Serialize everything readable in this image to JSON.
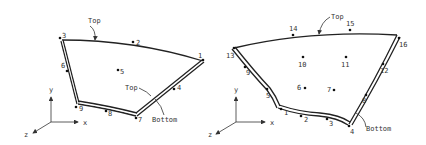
{
  "figures": [
    {
      "id": "left",
      "description": "9-node shell element",
      "nodes": [
        {
          "label": "1",
          "x": 203,
          "y": 60,
          "lx": 199,
          "ly": 57
        },
        {
          "label": "2",
          "x": 133,
          "y": 42,
          "lx": 137,
          "ly": 44
        },
        {
          "label": "3",
          "x": 60,
          "y": 39,
          "lx": 63,
          "ly": 37
        },
        {
          "label": "4",
          "x": 174,
          "y": 89,
          "lx": 177,
          "ly": 90
        },
        {
          "label": "5",
          "x": 118,
          "y": 70,
          "lx": 120,
          "ly": 74
        },
        {
          "label": "6",
          "x": 67,
          "y": 71,
          "lx": 61,
          "ly": 68
        },
        {
          "label": "7",
          "x": 136,
          "y": 117,
          "lx": 138,
          "ly": 122
        },
        {
          "label": "8",
          "x": 106,
          "y": 111,
          "lx": 108,
          "ly": 116
        },
        {
          "label": "9",
          "x": 77,
          "y": 106,
          "lx": 79,
          "ly": 111
        }
      ],
      "labels": [
        {
          "text": "Top",
          "x": 88,
          "y": 23
        },
        {
          "text": "Top",
          "x": 126,
          "y": 90
        },
        {
          "text": "Bottom",
          "x": 152,
          "y": 122
        }
      ],
      "axes": {
        "origin": [
          51,
          122
        ],
        "x_label": "x",
        "y_label": "y",
        "z_label": "z"
      }
    },
    {
      "id": "right",
      "description": "16-node shell element",
      "nodes": [
        {
          "label": "1",
          "x": 281,
          "y": 109,
          "lx": 284,
          "ly": 115
        },
        {
          "label": "2",
          "x": 301,
          "y": 116,
          "lx": 304,
          "ly": 122
        },
        {
          "label": "3",
          "x": 327,
          "y": 119,
          "lx": 329,
          "ly": 126
        },
        {
          "label": "4",
          "x": 349,
          "y": 126,
          "lx": 350,
          "ly": 134
        },
        {
          "label": "5",
          "x": 267,
          "y": 89,
          "lx": 266,
          "ly": 98
        },
        {
          "label": "6",
          "x": 305,
          "y": 88,
          "lx": 297,
          "ly": 90
        },
        {
          "label": "7",
          "x": 334,
          "y": 90,
          "lx": 327,
          "ly": 92
        },
        {
          "label": "8",
          "x": 366,
          "y": 95,
          "lx": 362,
          "ly": 103
        },
        {
          "label": "9",
          "x": 245,
          "y": 67,
          "lx": 246,
          "ly": 75
        },
        {
          "label": "10",
          "x": 303,
          "y": 57,
          "lx": 298,
          "ly": 67
        },
        {
          "label": "11",
          "x": 346,
          "y": 57,
          "lx": 341,
          "ly": 67
        },
        {
          "label": "12",
          "x": 383,
          "y": 64,
          "lx": 380,
          "ly": 73
        },
        {
          "label": "13",
          "x": 234,
          "y": 48,
          "lx": 226,
          "ly": 58
        },
        {
          "label": "14",
          "x": 293,
          "y": 35,
          "lx": 289,
          "ly": 31
        },
        {
          "label": "15",
          "x": 350,
          "y": 30,
          "lx": 346,
          "ly": 26
        },
        {
          "label": "16",
          "x": 398,
          "y": 37,
          "lx": 399,
          "ly": 47
        }
      ],
      "labels": [
        {
          "text": "Top",
          "x": 330,
          "y": 20
        },
        {
          "text": "Bottom",
          "x": 366,
          "y": 131
        }
      ],
      "axes": {
        "origin": [
          236,
          122
        ],
        "x_label": "x",
        "y_label": "y",
        "z_label": "z"
      }
    }
  ],
  "text": {
    "top": "Top",
    "bottom": "Bottom",
    "axis_x": "x",
    "axis_y": "y",
    "axis_z": "z"
  }
}
